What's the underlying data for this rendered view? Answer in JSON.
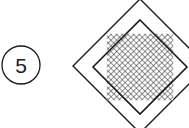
{
  "diagram": {
    "callout": {
      "number": "5",
      "cx": 21,
      "cy": 65,
      "r": 19
    },
    "outer_diamond": {
      "cx": 140,
      "cy": 66,
      "half": 67
    },
    "inner_diamond": {
      "cx": 140,
      "cy": 67,
      "half": 47,
      "fill": "crosshatch"
    },
    "colors": {
      "stroke": "#1a1a1a",
      "background": "#ffffff"
    }
  }
}
